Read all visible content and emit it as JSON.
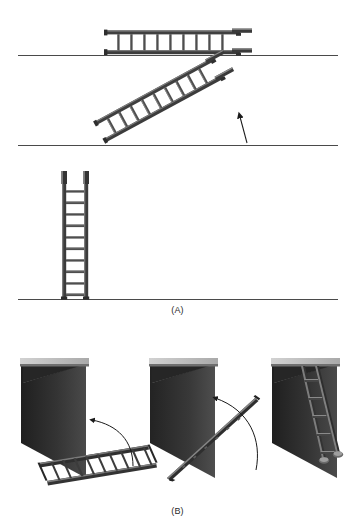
{
  "figure": {
    "panels": [
      {
        "id": "A",
        "caption": "(A)",
        "description": "Side elevation sequence of raising a ladder",
        "stages": [
          {
            "name": "ladder-horizontal",
            "state": "lying flat on ground",
            "rungs": 9,
            "angle_deg": 0
          },
          {
            "name": "ladder-inclined",
            "state": "being raised at an angle",
            "rungs": 9,
            "angle_deg": 30,
            "annotation": "upward-arrow"
          },
          {
            "name": "ladder-vertical",
            "state": "standing upright against support",
            "rungs": 10,
            "angle_deg": 90
          }
        ],
        "ground_lines": 3
      },
      {
        "id": "B",
        "caption": "(B)",
        "description": "Perspective sequence of raising a ladder against a wall",
        "stages": [
          {
            "name": "wall-with-flat-ladder",
            "state": "ladder lying flat beside wall",
            "rungs": 10,
            "annotation": "curved-arrow"
          },
          {
            "name": "wall-with-tilting-ladder",
            "state": "ladder rotated edge-on, mid-lift",
            "rungs": 0,
            "annotation": "curved-arrow"
          },
          {
            "name": "wall-with-leaning-ladder",
            "state": "ladder leaning against wall",
            "rungs": 5,
            "annotation": "none"
          }
        ]
      }
    ],
    "colors": {
      "background": "#ffffff",
      "line": "#1a1a1a",
      "ladder_dark": "#3a3a3a",
      "ladder_mid": "#5e5e5e",
      "ladder_light": "#8d8d8d",
      "wall_dark": "#2b2b2b",
      "wall_mid": "#3f3f3f",
      "wall_cap": "#b9b9b9",
      "wall_cap_shade": "#8e8e8e",
      "ground": "#4a4a4a",
      "caption_text": "#2a2a2a"
    }
  }
}
